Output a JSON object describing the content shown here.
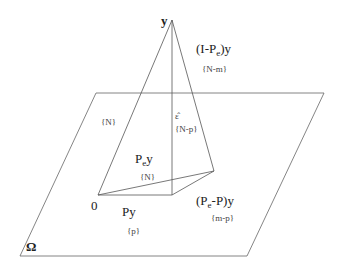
{
  "diagram": {
    "labels": {
      "apex": "y",
      "residual_full": "(I-P",
      "residual_full_sub": "e",
      "residual_full_tail": ")y",
      "residual_full_df": "{N-m}",
      "observation_df": "{N}",
      "epsilon_hat": "ε̂",
      "epsilon_df": "{N-p}",
      "pe_y": "P",
      "pe_y_sub": "e",
      "pe_y_tail": "y",
      "pe_y_df": "{N}",
      "origin": "0",
      "py": "Py",
      "py_df": "{p}",
      "pe_minus_p": "(P",
      "pe_minus_p_sub": "e",
      "pe_minus_p_tail": "-P)y",
      "pe_minus_p_df": "{m-p}",
      "plane": "Ω"
    },
    "colors": {
      "line": "#555555",
      "text": "#222222"
    }
  }
}
